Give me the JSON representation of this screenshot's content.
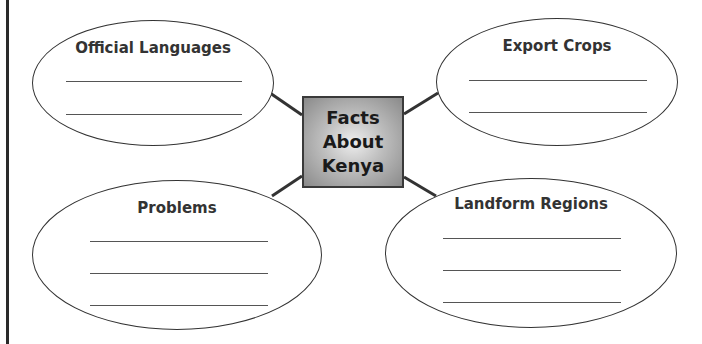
{
  "center": {
    "lines": [
      "Facts",
      "About",
      "Kenya"
    ]
  },
  "ovals": [
    {
      "id": "official-languages",
      "title": "Official Languages",
      "blank_lines": 2
    },
    {
      "id": "export-crops",
      "title": "Export Crops",
      "blank_lines": 2
    },
    {
      "id": "problems",
      "title": "Problems",
      "blank_lines": 3
    },
    {
      "id": "landform-regions",
      "title": "Landform Regions",
      "blank_lines": 3
    }
  ],
  "colors": {
    "stroke": "#333333",
    "box_edge": "#3a3a3a",
    "box_fill_center": "#eeeeee",
    "box_fill_edge": "#8a8a8a"
  }
}
